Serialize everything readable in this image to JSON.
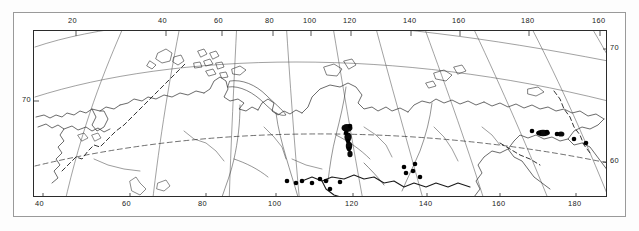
{
  "figure": {
    "kind": "map",
    "title": "",
    "projection": "conic",
    "region": "Northern Eurasia (Russia)",
    "background_color": "#ffffff",
    "line_color": "#2b2b2b",
    "frame_color": "#9a9a9a",
    "marker_color": "#000000"
  },
  "axes": {
    "top_labels": [
      {
        "text": "20",
        "x": 68
      },
      {
        "text": "40",
        "x": 158
      },
      {
        "text": "60",
        "x": 214
      },
      {
        "text": "80",
        "x": 265
      },
      {
        "text": "100",
        "x": 303
      },
      {
        "text": "120",
        "x": 343
      },
      {
        "text": "140",
        "x": 403
      },
      {
        "text": "160",
        "x": 452
      },
      {
        "text": "180",
        "x": 521
      },
      {
        "text": "160",
        "x": 592
      }
    ],
    "bottom_labels": [
      {
        "text": "40",
        "x": 35
      },
      {
        "text": "60",
        "x": 122
      },
      {
        "text": "80",
        "x": 198
      },
      {
        "text": "100",
        "x": 268
      },
      {
        "text": "120",
        "x": 345
      },
      {
        "text": "140",
        "x": 419
      },
      {
        "text": "160",
        "x": 492
      },
      {
        "text": "180",
        "x": 568
      }
    ],
    "left_labels": [
      {
        "text": "70",
        "x": 22,
        "y": 96
      }
    ],
    "right_labels": [
      {
        "text": "70",
        "x": 610,
        "y": 44
      },
      {
        "text": "60",
        "x": 610,
        "y": 157
      }
    ]
  },
  "chart_data": {
    "type": "map",
    "xlabel": "Longitude (°E)",
    "ylabel": "Latitude (°N)",
    "xlim": [
      20,
      180
    ],
    "ylim": [
      50,
      82
    ],
    "grid": true,
    "legend": "none",
    "graticule": {
      "meridians_deg": [
        20,
        40,
        60,
        80,
        100,
        120,
        140,
        160,
        180
      ],
      "parallels_deg": [
        60,
        70,
        80
      ],
      "dashed_parallel_deg": 60
    },
    "markers": {
      "style": "filled-circle",
      "count": 23,
      "points_px": [
        {
          "x": 253,
          "y": 150
        },
        {
          "x": 262,
          "y": 152
        },
        {
          "x": 268,
          "y": 150
        },
        {
          "x": 278,
          "y": 152
        },
        {
          "x": 286,
          "y": 148
        },
        {
          "x": 292,
          "y": 150
        },
        {
          "x": 296,
          "y": 158
        },
        {
          "x": 306,
          "y": 151
        },
        {
          "x": 312,
          "y": 102
        },
        {
          "x": 314,
          "y": 110
        },
        {
          "x": 315,
          "y": 118
        },
        {
          "x": 316,
          "y": 95
        },
        {
          "x": 370,
          "y": 136
        },
        {
          "x": 372,
          "y": 142
        },
        {
          "x": 379,
          "y": 140
        },
        {
          "x": 381,
          "y": 133
        },
        {
          "x": 386,
          "y": 146
        },
        {
          "x": 498,
          "y": 100
        },
        {
          "x": 505,
          "y": 102
        },
        {
          "x": 513,
          "y": 101
        },
        {
          "x": 523,
          "y": 103
        },
        {
          "x": 540,
          "y": 108
        },
        {
          "x": 552,
          "y": 112
        }
      ]
    }
  }
}
